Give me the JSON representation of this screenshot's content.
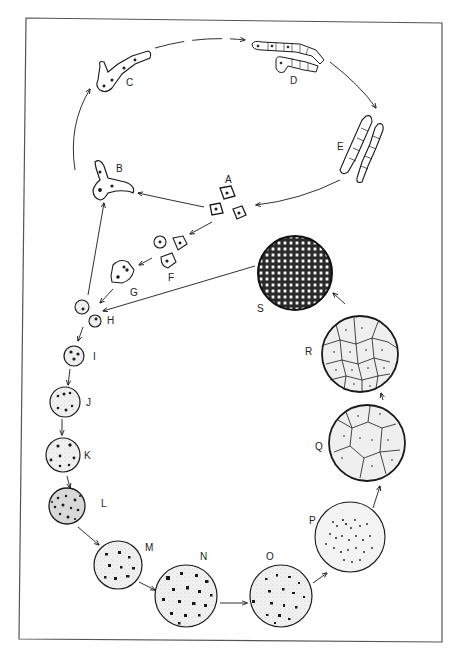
{
  "figure": {
    "frame_color": "#555555",
    "ink_color": "#1a1a1a",
    "stipple_fill": "#ececec"
  },
  "stages": [
    {
      "id": "A",
      "label": "A",
      "shape": "angular cells (three)"
    },
    {
      "id": "B",
      "label": "B",
      "shape": "branching cell"
    },
    {
      "id": "C",
      "label": "C",
      "shape": "branched filament"
    },
    {
      "id": "D",
      "label": "D",
      "shape": "segmented filaments"
    },
    {
      "id": "E",
      "label": "E",
      "shape": "segmented chains"
    },
    {
      "id": "F",
      "label": "F",
      "shape": "small cells (three)"
    },
    {
      "id": "G",
      "label": "G",
      "shape": "irregular cell with nuclei"
    },
    {
      "id": "H",
      "label": "H",
      "shape": "small round cells (two)"
    },
    {
      "id": "I",
      "label": "I",
      "shape": "stippled sphere, few dots"
    },
    {
      "id": "J",
      "label": "J",
      "shape": "stippled sphere"
    },
    {
      "id": "K",
      "label": "K",
      "shape": "stippled sphere"
    },
    {
      "id": "L",
      "label": "L",
      "shape": "dense stippled sphere"
    },
    {
      "id": "M",
      "label": "M",
      "shape": "sphere with dark bodies"
    },
    {
      "id": "N",
      "label": "N",
      "shape": "sphere with many dark bodies"
    },
    {
      "id": "O",
      "label": "O",
      "shape": "sphere with scattered bodies"
    },
    {
      "id": "P",
      "label": "P",
      "shape": "sphere with fine dots"
    },
    {
      "id": "Q",
      "label": "Q",
      "shape": "sphere divided into polygonal cells"
    },
    {
      "id": "R",
      "label": "R",
      "shape": "sphere with more polygonal cells"
    },
    {
      "id": "S",
      "label": "S",
      "shape": "sphere densely packed with small cells"
    }
  ],
  "arrows": [
    {
      "from": "A",
      "to": "B"
    },
    {
      "from": "B",
      "to": "C"
    },
    {
      "from": "C",
      "to": "D"
    },
    {
      "from": "D",
      "to": "E"
    },
    {
      "from": "E",
      "to": "A"
    },
    {
      "from": "A",
      "to": "F"
    },
    {
      "from": "F",
      "to": "G"
    },
    {
      "from": "G",
      "to": "H"
    },
    {
      "from": "H",
      "to": "B"
    },
    {
      "from": "H",
      "to": "I"
    },
    {
      "from": "I",
      "to": "J"
    },
    {
      "from": "J",
      "to": "K"
    },
    {
      "from": "K",
      "to": "L"
    },
    {
      "from": "L",
      "to": "M"
    },
    {
      "from": "M",
      "to": "N"
    },
    {
      "from": "N",
      "to": "O"
    },
    {
      "from": "O",
      "to": "P"
    },
    {
      "from": "P",
      "to": "Q"
    },
    {
      "from": "Q",
      "to": "R"
    },
    {
      "from": "R",
      "to": "S"
    },
    {
      "from": "S",
      "to": "H"
    }
  ]
}
